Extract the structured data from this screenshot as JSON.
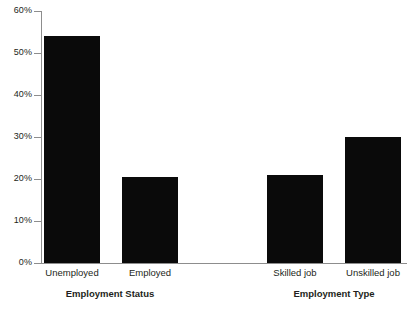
{
  "chart_data": {
    "type": "bar",
    "title": "",
    "xlabel": "",
    "ylabel": "",
    "ylim": [
      0,
      60
    ],
    "grid": false,
    "legend": null,
    "y_tick_labels": [
      "60%",
      "50%",
      "40%",
      "30%",
      "20%",
      "10%",
      "0%"
    ],
    "y_tick_values": [
      60,
      50,
      40,
      30,
      20,
      10,
      0
    ],
    "categories": [
      "Unemployed",
      "Employed",
      "Skilled job",
      "Unskilled job"
    ],
    "values": [
      54,
      20.5,
      21,
      30
    ],
    "bar_color": "#0a0a0a",
    "axis_color": "#8d8d8d",
    "groups": [
      {
        "label": "Employment Status",
        "categories": [
          "Unemployed",
          "Employed"
        ],
        "values": [
          54,
          20.5
        ]
      },
      {
        "label": "Employment Type",
        "categories": [
          "Skilled job",
          "Unskilled job"
        ],
        "values": [
          21,
          30
        ]
      }
    ]
  }
}
